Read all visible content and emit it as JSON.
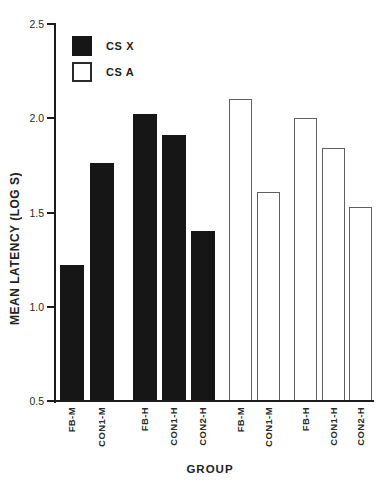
{
  "figure": {
    "background": "#ffffff",
    "ink_color": "#1c1c1c"
  },
  "chart": {
    "y_axis": {
      "title": "MEAN LATENCY (LOG S)",
      "tick_labels": [
        "2.5",
        "2.0",
        "1.5",
        "1.0",
        "0.5"
      ]
    },
    "x_axis": {
      "title": "GROUP"
    },
    "legend": {
      "items": [
        {
          "label": "CS X",
          "swatch": "filled-black"
        },
        {
          "label": "CS A",
          "swatch": "open-white"
        }
      ]
    }
  },
  "chart_data": {
    "type": "bar",
    "title": "",
    "xlabel": "GROUP",
    "ylabel": "MEAN LATENCY (LOG S)",
    "ylim": [
      0.5,
      2.5
    ],
    "ytick_step": 0.5,
    "grid": false,
    "legend_position": "upper-left-inside",
    "categories": [
      "FB-M",
      "CON1-M",
      "FB-H",
      "CON1-H",
      "CON2-H"
    ],
    "series": [
      {
        "name": "CS X",
        "style": "filled-black",
        "values": [
          1.22,
          1.76,
          2.02,
          1.91,
          1.4
        ]
      },
      {
        "name": "CS A",
        "style": "open-white",
        "values": [
          2.1,
          1.61,
          2.0,
          1.84,
          1.53
        ]
      }
    ],
    "colors": {
      "bar_fill": "#161616",
      "bar_outline": "#5f5f5f",
      "axis": "#1c1c1c",
      "background": "#ffffff"
    }
  }
}
